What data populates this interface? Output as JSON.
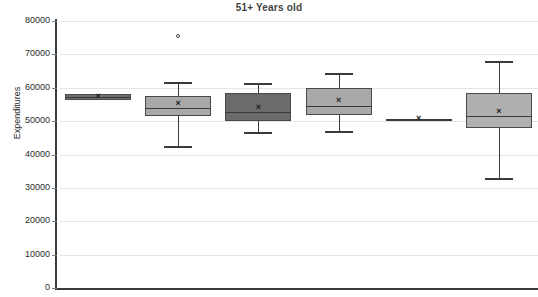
{
  "chart_data": {
    "type": "box",
    "title": "51+ Years old",
    "xlabel": "",
    "ylabel": "Expenditures",
    "ylim": [
      0,
      80000
    ],
    "ytick_labels": [
      "80000",
      "70000",
      "60000",
      "50000",
      "40000",
      "30000",
      "20000",
      "10000",
      "0"
    ],
    "ytick_values": [
      80000,
      70000,
      60000,
      50000,
      40000,
      30000,
      20000,
      10000,
      0
    ],
    "grid": "horizontal",
    "legend": "none",
    "categories": [
      "1",
      "2",
      "3",
      "4",
      "5",
      "6"
    ],
    "boxes": [
      {
        "name": "box-1",
        "whisker_low": 57000,
        "q1": 56300,
        "median": 57300,
        "q3": 58200,
        "whisker_high": 58200,
        "mean": 57300,
        "outliers": [],
        "fill": "#6f6f6f"
      },
      {
        "name": "box-2",
        "whisker_low": 42400,
        "q1": 51500,
        "median": 54000,
        "q3": 57400,
        "whisker_high": 61800,
        "mean": 55100,
        "outliers": [
          75600
        ],
        "fill": "#a8a8a8"
      },
      {
        "name": "box-3",
        "whisker_low": 46800,
        "q1": 50000,
        "median": 52800,
        "q3": 58400,
        "whisker_high": 61300,
        "mean": 54000,
        "outliers": [],
        "fill": "#6b6b6b"
      },
      {
        "name": "box-4",
        "whisker_low": 46900,
        "q1": 51900,
        "median": 54400,
        "q3": 59900,
        "whisker_high": 64500,
        "mean": 56100,
        "outliers": [],
        "fill": "#a8a8a8"
      },
      {
        "name": "box-5",
        "whisker_low": 50600,
        "q1": 50600,
        "median": 50600,
        "q3": 50700,
        "whisker_high": 50700,
        "mean": 50600,
        "outliers": [],
        "fill": "#a8a8a8"
      },
      {
        "name": "box-6",
        "whisker_low": 33000,
        "q1": 48000,
        "median": 51500,
        "q3": 58400,
        "whisker_high": 68100,
        "mean": 52700,
        "outliers": [],
        "fill": "#b0b0b0"
      }
    ],
    "mean_marker_glyph": "×",
    "colors": {
      "grid": "#e3e3e3",
      "axis": "#3a3a3a",
      "title": "#3f3f3f",
      "text": "#2b2b2b",
      "box_dark": "#6b6b6b",
      "box_light": "#a8a8a8"
    }
  }
}
